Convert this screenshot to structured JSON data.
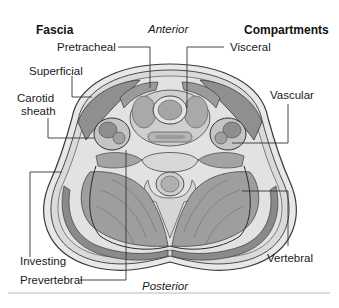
{
  "headers": {
    "left": "Fascia",
    "right": "Compartments"
  },
  "orientation": {
    "top": "Anterior",
    "bottom": "Posterior"
  },
  "fascia_labels": [
    {
      "id": "pretracheal",
      "text": "Pretracheal"
    },
    {
      "id": "superficial",
      "text": "Superficial"
    },
    {
      "id": "carotid-sheath",
      "text": "Carotid\nsheath",
      "line1": "Carotid",
      "line2": "sheath"
    },
    {
      "id": "investing",
      "text": "Investing"
    },
    {
      "id": "prevertebral",
      "text": "Prevertebral"
    }
  ],
  "compartment_labels": [
    {
      "id": "visceral",
      "text": "Visceral"
    },
    {
      "id": "vascular",
      "text": "Vascular"
    },
    {
      "id": "vertebral",
      "text": "Vertebral"
    }
  ],
  "colors": {
    "background": "#ffffff",
    "skin": "#e6e6e6",
    "outline": "#3a3a3a",
    "muscle_dark": "#8a8a8a",
    "muscle_mid": "#a8a8a8",
    "tissue_light": "#d2d2d2",
    "leader_line": "#333333",
    "rule": "#dcdcdc"
  }
}
